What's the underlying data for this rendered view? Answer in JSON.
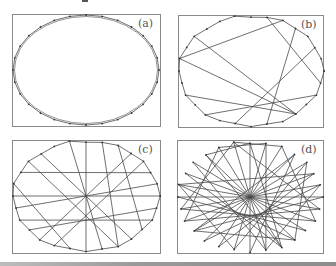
{
  "figure": {
    "colors": {
      "frame": "#8a8a8a",
      "edge": "#4a4a4a",
      "vertex": "#333333",
      "label": "#555555"
    },
    "panels": [
      {
        "id": "a",
        "label": "(a)",
        "frame": {
          "x": 12,
          "y": 14,
          "w": 148,
          "h": 112
        },
        "ellipse": {
          "cx": 86,
          "cy": 70,
          "rx": 73,
          "ry": 55
        },
        "n": 28,
        "edges_type": "cycle",
        "extra_chords": []
      },
      {
        "id": "b",
        "label": "(b)",
        "frame": {
          "x": 178,
          "y": 15,
          "w": 145,
          "h": 112
        },
        "ellipse": {
          "cx": 251,
          "cy": 71,
          "rx": 72,
          "ry": 55
        },
        "n": 28,
        "edges_type": "cycle-with-chords",
        "extra_chords": [
          [
            11,
            19
          ],
          [
            11,
            22
          ],
          [
            11,
            24
          ],
          [
            8,
            1
          ],
          [
            3,
            13
          ],
          [
            15,
            5
          ],
          [
            22,
            2
          ],
          [
            17,
            9
          ]
        ]
      },
      {
        "id": "c",
        "label": "(c)",
        "frame": {
          "x": 12,
          "y": 140,
          "w": 148,
          "h": 113
        },
        "ellipse": {
          "cx": 86,
          "cy": 196,
          "rx": 73,
          "ry": 55
        },
        "n": 28,
        "edges_type": "cycle-with-chords",
        "extra_chords": [
          [
            7,
            21
          ],
          [
            14,
            0
          ],
          [
            11,
            25
          ],
          [
            12,
            1
          ],
          [
            9,
            19
          ],
          [
            16,
            4
          ],
          [
            17,
            3
          ],
          [
            20,
            6
          ],
          [
            10,
            2
          ],
          [
            23,
            5
          ],
          [
            13,
            27
          ],
          [
            18,
            8
          ],
          [
            15,
            22
          ],
          [
            24,
            12
          ]
        ]
      },
      {
        "id": "d",
        "label": "(d)",
        "frame": {
          "x": 177,
          "y": 140,
          "w": 146,
          "h": 113
        },
        "ellipse": {
          "cx": 250,
          "cy": 197,
          "rx": 72,
          "ry": 55
        },
        "n": 28,
        "edges_type": "random-tour",
        "extra_chords": [
          [
            0,
            14
          ],
          [
            14,
            3
          ],
          [
            3,
            17
          ],
          [
            17,
            6
          ],
          [
            6,
            20
          ],
          [
            20,
            9
          ],
          [
            9,
            23
          ],
          [
            23,
            12
          ],
          [
            12,
            26
          ],
          [
            26,
            1
          ],
          [
            1,
            15
          ],
          [
            15,
            4
          ],
          [
            4,
            18
          ],
          [
            18,
            7
          ],
          [
            7,
            21
          ],
          [
            21,
            10
          ],
          [
            10,
            24
          ],
          [
            24,
            13
          ],
          [
            13,
            27
          ],
          [
            27,
            2
          ],
          [
            2,
            16
          ],
          [
            16,
            5
          ],
          [
            5,
            19
          ],
          [
            19,
            8
          ],
          [
            8,
            22
          ],
          [
            22,
            11
          ],
          [
            11,
            25
          ],
          [
            25,
            0
          ],
          [
            0,
            12
          ],
          [
            12,
            25
          ],
          [
            4,
            11
          ],
          [
            11,
            18
          ],
          [
            18,
            3
          ],
          [
            6,
            13
          ],
          [
            13,
            1
          ],
          [
            9,
            2
          ],
          [
            20,
            27
          ],
          [
            27,
            8
          ],
          [
            15,
            22
          ],
          [
            22,
            5
          ],
          [
            19,
            26
          ]
        ]
      }
    ]
  }
}
